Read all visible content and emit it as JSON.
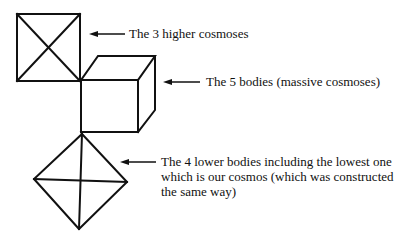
{
  "diagram": {
    "type": "cosmos-structure-schematic",
    "stroke_color": "#111111",
    "background_color": "#ffffff",
    "shapes": [
      {
        "id": "square",
        "name": "Square with diagonals",
        "represents": "higher cosmoses"
      },
      {
        "id": "cube",
        "name": "Cube (wireframe)",
        "represents": "bodies"
      },
      {
        "id": "diamond",
        "name": "Diamond with cross",
        "represents": "lower bodies"
      }
    ],
    "labels": {
      "higher_cosmoses": "The 3 higher cosmoses",
      "five_bodies": "The 5 bodies (massive cosmoses)",
      "lower_bodies_line1": "The 4 lower bodies including the lowest one",
      "lower_bodies_line2": "which is our cosmos (which was constructed",
      "lower_bodies_line3": "the same way)"
    }
  }
}
